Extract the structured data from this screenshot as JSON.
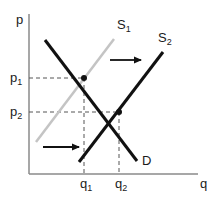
{
  "diagram": {
    "axes": {
      "y_label": "p",
      "x_label": "q"
    },
    "price_ticks": [
      {
        "base": "p",
        "sub": "1"
      },
      {
        "base": "p",
        "sub": "2"
      }
    ],
    "quantity_ticks": [
      {
        "base": "q",
        "sub": "1"
      },
      {
        "base": "q",
        "sub": "2"
      }
    ],
    "curves": [
      {
        "name": "S",
        "sub": "1",
        "color": "#c4c4c4",
        "kind": "supply-original"
      },
      {
        "name": "S",
        "sub": "2",
        "color": "#111111",
        "kind": "supply-shifted"
      },
      {
        "name": "D",
        "sub": "",
        "color": "#111111",
        "kind": "demand"
      }
    ],
    "arrows": [
      {
        "direction": "right",
        "meaning": "supply shift"
      },
      {
        "direction": "right",
        "meaning": "supply shift"
      }
    ],
    "equilibria": [
      {
        "label": "E1",
        "price": "p1",
        "quantity": "q1"
      },
      {
        "label": "E2",
        "price": "p2",
        "quantity": "q2"
      }
    ],
    "colors": {
      "axis": "#8a8a8a",
      "dashed": "#555555",
      "s1": "#c4c4c4",
      "s2": "#111111",
      "demand": "#111111"
    }
  }
}
